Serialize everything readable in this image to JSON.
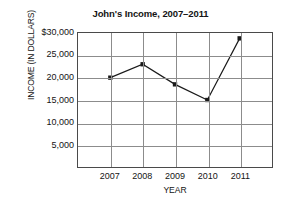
{
  "chart_data": {
    "type": "line",
    "title": "John's Income, 2007–2011",
    "xlabel": "YEAR",
    "ylabel": "INCOME (IN DOLLARS)",
    "categories": [
      "2007",
      "2008",
      "2009",
      "2010",
      "2011"
    ],
    "values": [
      20000,
      23000,
      18500,
      15000,
      28800
    ],
    "ytick_labels": [
      "$30,000",
      "25,000",
      "20,000",
      "15,000",
      "10,000",
      "5,000"
    ],
    "ytick_values": [
      30000,
      25000,
      20000,
      15000,
      10000,
      5000
    ],
    "ylim": [
      0,
      30000
    ],
    "grid": "both",
    "legend": "none",
    "marker": "filled-square",
    "line_color": "#1a1a1a",
    "grid_color": "#8c8c8c",
    "frame_color": "#4a4a4a",
    "background": "#ffffff",
    "x_categories_slots": 6,
    "note": "An extra empty column is drawn to the right of 2011"
  }
}
